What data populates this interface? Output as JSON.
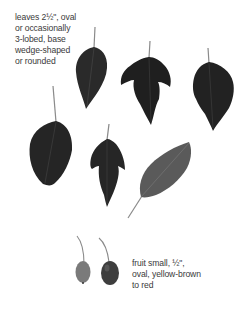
{
  "captions": {
    "leaves": {
      "lines": [
        "leaves 2½\", oval",
        "or occasionally",
        "3-lobed, base",
        "wedge-shaped",
        "or rounded"
      ]
    },
    "fruit": {
      "lines": [
        "fruit small, ½\",",
        "oval, yellow-brown",
        "to red"
      ]
    }
  },
  "illustrations": {
    "leaves": [
      {
        "name": "oval-leaf-top-left",
        "color": "#2a2a2a"
      },
      {
        "name": "three-lobed-leaf-top-center",
        "color": "#1f1f1f"
      },
      {
        "name": "lobed-leaf-top-right",
        "color": "#222222"
      },
      {
        "name": "oval-leaf-mid-left",
        "color": "#252525"
      },
      {
        "name": "lobed-leaf-mid-center",
        "color": "#262626"
      },
      {
        "name": "oval-leaf-mid-right-gray",
        "color": "#5a5a5a"
      }
    ],
    "fruits": [
      {
        "name": "fruit-left",
        "color": "#7a7a7a"
      },
      {
        "name": "fruit-right",
        "color": "#3e3e3e"
      }
    ]
  }
}
